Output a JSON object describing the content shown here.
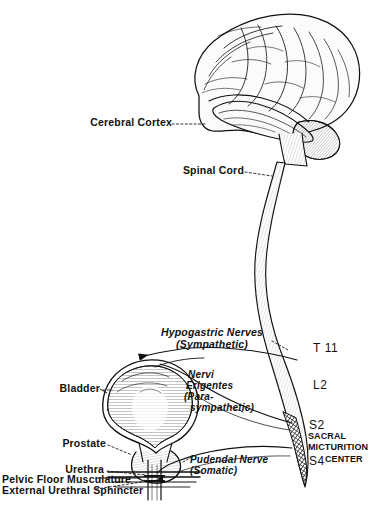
{
  "figure": {
    "type": "anatomical-line-drawing",
    "background_color": "#ffffff",
    "ink_color": "#111111"
  },
  "structures": {
    "brain": "cerebral-hemisphere-lateral-view",
    "brainstem": "brainstem",
    "cord": "spinal-cord",
    "conus": "conus-medullaris",
    "sacral_center_shading": "cross-hatched-segment",
    "bladder": "urinary-bladder",
    "prostate": "prostate-gland",
    "urethra": "urethra",
    "pelvic_floor": "pelvic-floor-musculature",
    "sphincter": "external-urethral-sphincter"
  },
  "labels": {
    "cerebral_cortex": "Cerebral Cortex",
    "spinal_cord": "Spinal Cord",
    "hypogastric_l1": "Hypogastric Nerves",
    "hypogastric_l2": "(Sympathetic)",
    "nervi_l1": "Nervi",
    "nervi_l2": "Erigentes",
    "nervi_l3": "(Para-",
    "nervi_l4": "sympathetic)",
    "pudendal_l1": "Pudendal Nerve",
    "pudendal_l2": "(Somatic)",
    "bladder": "Bladder",
    "prostate": "Prostate",
    "urethra": "Urethra",
    "pelvic_floor": "Pelvic Floor Musculature",
    "sphincter": "External Urethral Sphincter"
  },
  "spinal_levels": {
    "t11": "T 11",
    "l2": "L2",
    "s2": "S2",
    "s4": "S4"
  },
  "sacral_center": {
    "line1": "SACRAL",
    "line2": "MICTURITION",
    "line3": "CENTER"
  }
}
